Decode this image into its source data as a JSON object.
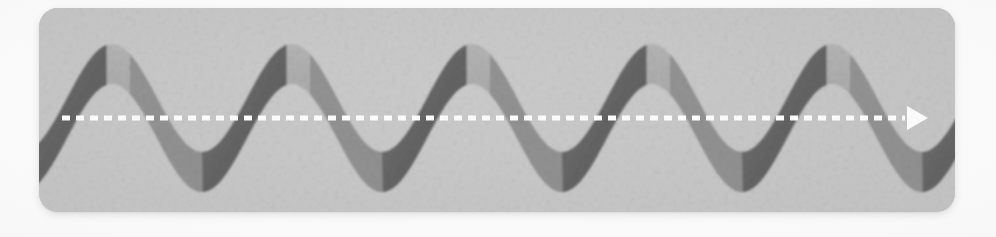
{
  "page": {
    "canvas_width": 996,
    "canvas_height": 237,
    "background_color": "#fafafa"
  },
  "card": {
    "name": "illustration-card",
    "x": 39,
    "y": 8,
    "width": 916,
    "height": 204,
    "corner_radius": 19,
    "background_color": "#c6c6c6",
    "background_color_light": "#cccccc",
    "background_color_dark": "#b9b9b9"
  },
  "illustration": {
    "kind": "twisted-ribbon-sine-wave",
    "ribbon_face_color": "#a5a5a5",
    "ribbon_face_color_light": "#b2b2b2",
    "ribbon_edge_color": "#6a6a6a",
    "ribbon_edge_color_dark": "#5c5c5c",
    "cycles_visible": 5,
    "period_px": 180,
    "amplitude_px": 54,
    "band_thickness_px": 40,
    "first_peak_center_x": 112,
    "baseline_y": 118
  },
  "guide_line": {
    "name": "dashed-axis-line",
    "color": "#ffffff",
    "start_x": 62,
    "end_x": 905,
    "y": 118,
    "dash_length": 8,
    "dash_gap": 6,
    "stroke_width": 5,
    "arrowhead": {
      "name": "arrow-marker",
      "shape": "triangle-right",
      "tip_x": 928,
      "center_y": 118,
      "width": 21,
      "height": 24,
      "color": "#ffffff"
    }
  },
  "chart_data": {
    "type": "line",
    "xlabel": "",
    "ylabel": "",
    "grid": false,
    "legend_position": "none",
    "xlim": [
      0,
      916
    ],
    "ylim": [
      -54,
      54
    ],
    "annotations": [
      "dashed white zero axis with right arrowhead"
    ],
    "series": [
      {
        "name": "sine-ribbon-upper-edge",
        "amplitude": 54,
        "period": 180,
        "phase_px": 112,
        "offset": 20
      },
      {
        "name": "sine-ribbon-lower-edge",
        "amplitude": 54,
        "period": 180,
        "phase_px": 112,
        "offset": -20
      },
      {
        "name": "zero-axis",
        "values": [
          0,
          0
        ],
        "x": [
          23,
          866
        ]
      }
    ]
  }
}
